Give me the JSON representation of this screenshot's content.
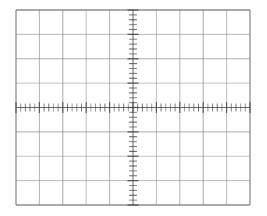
{
  "figure": {
    "kind": "oscilloscope-graticule",
    "caption": ""
  },
  "chart_data": {
    "type": "scatter",
    "subtitle": "",
    "xlabel": "",
    "ylabel": "",
    "series": [],
    "x": [],
    "values": [],
    "categories": [],
    "annotations": [],
    "legend_position": "none",
    "grid": true,
    "xlim": [
      -5,
      5
    ],
    "ylim": [
      -4,
      4
    ],
    "horizontal_divisions": 10,
    "vertical_divisions": 8,
    "minor_ticks_per_division": 5,
    "x_axis_tick_count": 51,
    "y_axis_tick_count": 41
  },
  "geometry": {
    "plot_left": 16,
    "plot_top": 10,
    "plot_right": 250,
    "plot_bottom": 205,
    "center_x": 133,
    "center_y": 107.5,
    "division_width": 23.4,
    "division_height": 24.375,
    "x_tick_half_length": 4.0,
    "y_tick_half_length": 4.0,
    "x_major_tick_half_length": 5.5,
    "y_major_tick_half_length": 5.5
  },
  "style": {
    "background_color": "#fefefe",
    "grid_color": "#8b8b8b",
    "border_color": "#7a7a7a",
    "axis_color": "#5a5a5a",
    "tick_color": "#4a4a4a",
    "grid_line_width": 0.9,
    "border_line_width": 1.3,
    "axis_line_width": 1.0,
    "tick_line_width": 0.9
  }
}
